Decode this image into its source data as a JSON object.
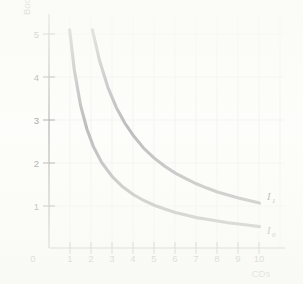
{
  "figure": {
    "background_color": "#fdfdfb",
    "axis_color": "#6e6e70",
    "grid_color": "#e9e9ec",
    "curve_color": "#7d7d82"
  },
  "chart_data": {
    "type": "line",
    "title": "",
    "xlabel": "CDs",
    "ylabel": "Books",
    "xlim": [
      0,
      10.7
    ],
    "ylim": [
      0,
      5.45
    ],
    "xticks": [
      0,
      1,
      2,
      3,
      4,
      5,
      6,
      7,
      8,
      9,
      10
    ],
    "xtick_labels": [
      "0",
      "1",
      "2",
      "3",
      "4",
      "5",
      "6",
      "7",
      "8",
      "9",
      "10"
    ],
    "yticks": [
      1,
      2,
      3,
      4,
      5
    ],
    "ytick_labels": [
      "1",
      "2",
      "3",
      "4",
      "5"
    ],
    "grid": true,
    "legend": "inline-end-labels",
    "series": [
      {
        "name": "I_1",
        "label_main": "I",
        "label_sub": "1",
        "description": "upper indifference curve, hyperbola Books = 10.5 / CDs",
        "constant": 10.5,
        "x": [
          2.06,
          2.4,
          2.8,
          3.2,
          3.6,
          4.0,
          4.5,
          5.0,
          5.5,
          6.0,
          6.5,
          7.0,
          7.5,
          8.0,
          8.5,
          9.0,
          9.5,
          10.0
        ],
        "y": [
          5.1,
          4.38,
          3.75,
          3.28,
          2.92,
          2.63,
          2.33,
          2.1,
          1.91,
          1.75,
          1.62,
          1.5,
          1.4,
          1.31,
          1.24,
          1.17,
          1.11,
          1.05
        ]
      },
      {
        "name": "I_0",
        "label_main": "I",
        "label_sub": "0",
        "description": "lower indifference curve, hyperbola Books = 5.0 / CDs",
        "constant": 5.0,
        "x": [
          0.98,
          1.2,
          1.5,
          1.8,
          2.1,
          2.5,
          3.0,
          3.5,
          4.0,
          4.5,
          5.0,
          5.5,
          6.0,
          6.5,
          7.0,
          7.5,
          8.0,
          8.5,
          9.0,
          9.5,
          10.0
        ],
        "y": [
          5.1,
          4.17,
          3.33,
          2.78,
          2.38,
          2.0,
          1.67,
          1.43,
          1.25,
          1.11,
          1.0,
          0.91,
          0.83,
          0.77,
          0.71,
          0.67,
          0.63,
          0.59,
          0.56,
          0.53,
          0.5
        ]
      }
    ]
  },
  "axis_labels": {
    "x_title": "CDs",
    "y_title": "Books",
    "origin": "0"
  }
}
